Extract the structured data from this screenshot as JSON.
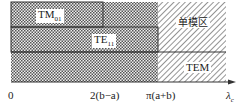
{
  "diagram": {
    "regions": [
      {
        "name": "TM01",
        "label_main": "TM",
        "label_sub": "01"
      },
      {
        "name": "TE11",
        "label_main": "TE",
        "label_sub": "11"
      },
      {
        "name": "TEM",
        "label_main": "TEM",
        "label_sub": ""
      },
      {
        "name": "single-mode",
        "label_main": "单模区",
        "label_sub": ""
      }
    ],
    "axis": {
      "ticks": [
        "0",
        "2(b−a)",
        "π(a+b)"
      ],
      "label_main": "λ",
      "label_sub": "c"
    },
    "colors": {
      "line": "#333333",
      "hatch": "#555555"
    }
  }
}
